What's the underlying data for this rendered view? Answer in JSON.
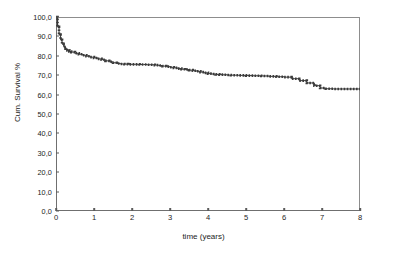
{
  "chart_data": {
    "type": "line",
    "title": "",
    "xlabel": "time (years)",
    "ylabel": "Cum. Survival %",
    "xlim": [
      0,
      8
    ],
    "ylim": [
      0,
      100
    ],
    "grid": false,
    "legend": null,
    "xticks": [
      "0",
      "1",
      "2",
      "3",
      "4",
      "5",
      "6",
      "7",
      "8"
    ],
    "xtick_values": [
      0,
      1,
      2,
      3,
      4,
      5,
      6,
      7,
      8
    ],
    "yticks": [
      "0,0",
      "10,0",
      "20,0",
      "30,0",
      "40,0",
      "50,0",
      "60,0",
      "70,0",
      "80,0",
      "90,0",
      "100,0"
    ],
    "ytick_values": [
      0,
      10,
      20,
      30,
      40,
      50,
      60,
      70,
      80,
      90,
      100
    ],
    "series": [
      {
        "name": "Cumulative survival",
        "style": "dotted-step",
        "color": "#3a3a3a",
        "x": [
          0.0,
          0.04,
          0.08,
          0.12,
          0.16,
          0.2,
          0.25,
          0.3,
          0.35,
          0.4,
          0.5,
          0.6,
          0.7,
          0.8,
          0.9,
          1.0,
          1.1,
          1.2,
          1.3,
          1.4,
          1.5,
          1.6,
          1.7,
          1.8,
          1.9,
          2.0,
          2.1,
          2.2,
          2.3,
          2.4,
          2.5,
          2.6,
          2.7,
          2.8,
          2.9,
          3.0,
          3.1,
          3.2,
          3.3,
          3.4,
          3.5,
          3.6,
          3.7,
          3.8,
          3.9,
          4.0,
          4.1,
          4.2,
          4.3,
          4.4,
          4.5,
          4.6,
          4.7,
          4.8,
          4.9,
          5.0,
          5.2,
          5.4,
          5.6,
          5.8,
          6.0,
          6.2,
          6.4,
          6.6,
          6.8,
          6.95,
          7.1,
          7.3,
          7.5,
          7.7,
          8.0
        ],
        "y": [
          100.0,
          95.0,
          91.0,
          88.2,
          86.2,
          84.8,
          83.6,
          82.8,
          82.2,
          81.9,
          81.3,
          80.8,
          80.3,
          79.8,
          79.3,
          78.9,
          78.4,
          78.0,
          77.4,
          76.9,
          76.4,
          76.0,
          75.8,
          75.7,
          75.6,
          75.6,
          75.6,
          75.5,
          75.5,
          75.4,
          75.4,
          75.2,
          75.0,
          74.7,
          74.4,
          74.1,
          73.8,
          73.4,
          73.1,
          72.9,
          72.6,
          72.3,
          72.0,
          71.6,
          71.2,
          70.8,
          70.6,
          70.4,
          70.3,
          70.2,
          70.1,
          70.0,
          70.0,
          69.9,
          69.9,
          69.8,
          69.7,
          69.6,
          69.4,
          69.2,
          69.0,
          68.2,
          67.2,
          66.0,
          64.6,
          63.4,
          63.0,
          62.9,
          62.9,
          62.9,
          62.9
        ]
      }
    ],
    "annotations": [
      {
        "text": "Steep early drop from 100% to about 82% within the first 0.4 years"
      },
      {
        "text": "Plateau at about 63% from year 7 to year 8"
      }
    ]
  },
  "axes": {
    "y_title": "Cum. Survival %",
    "x_title": "time (years)"
  },
  "colors": {
    "curve": "#3a3a3a",
    "axis": "#6f6f6f",
    "frame": "#8d8d8d",
    "background": "#ffffff",
    "text": "#1c1c1c"
  }
}
